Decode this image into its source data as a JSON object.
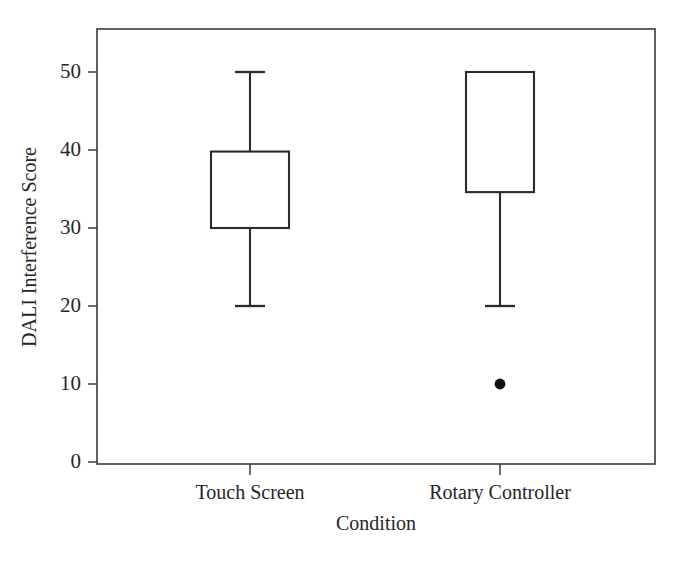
{
  "chart_data": {
    "type": "box",
    "title": "",
    "xlabel": "Condition",
    "ylabel": "DALI Interference Score",
    "categories": [
      "Touch Screen",
      "Rotary Controller"
    ],
    "ylim": [
      0,
      55
    ],
    "ytick_labels": [
      "0",
      "10",
      "20",
      "30",
      "40",
      "50"
    ],
    "ytick_values": [
      0,
      10,
      20,
      30,
      40,
      50
    ],
    "grid": false,
    "legend": "none",
    "boxes": [
      {
        "category": "Touch Screen",
        "whisker_low": 20,
        "q1": 30,
        "median": null,
        "q3": 39.8,
        "whisker_high": 50,
        "outliers": []
      },
      {
        "category": "Rotary Controller",
        "whisker_low": 20,
        "q1": 34.6,
        "median": null,
        "q3": 50,
        "whisker_high": 50,
        "outliers": [
          10
        ]
      }
    ]
  },
  "style": {
    "line_color": "#2b2b2b",
    "frame_color": "#3a3a3a",
    "text_color": "#262626",
    "background": "#ffffff",
    "outlier_color": "#111111"
  },
  "geometry": {
    "plot_left": 97,
    "plot_right": 655,
    "plot_top": 29,
    "plot_bottom": 464,
    "y_zero_px": 462,
    "y_fifty_px": 72,
    "cat_x": [
      250,
      500
    ],
    "box_half_width": [
      39,
      34
    ],
    "cap_half_width": 15
  }
}
